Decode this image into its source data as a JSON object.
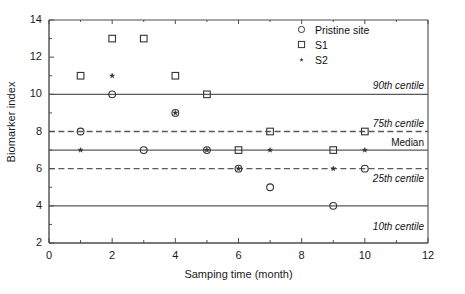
{
  "chart_data": {
    "type": "scatter",
    "title": "",
    "xlabel": "Samping time (month)",
    "ylabel": "Biomarker index",
    "xlim": [
      0,
      12
    ],
    "ylim": [
      2,
      14
    ],
    "xticks": [
      0,
      2,
      4,
      6,
      8,
      10,
      12
    ],
    "yticks": [
      2,
      4,
      6,
      8,
      10,
      12,
      14
    ],
    "xminor_step": 1,
    "yminor_step": 1,
    "grid": false,
    "legend_position": "top-right",
    "series": [
      {
        "name": "Pristine site",
        "marker": "circle",
        "x": [
          1,
          2,
          3,
          4,
          5,
          6,
          7,
          9,
          10
        ],
        "y": [
          8,
          10,
          7,
          9,
          7,
          6,
          5,
          4,
          6
        ]
      },
      {
        "name": "S1",
        "marker": "square",
        "x": [
          1,
          2,
          3,
          4,
          5,
          6,
          7,
          9,
          10
        ],
        "y": [
          11,
          13,
          13,
          11,
          10,
          7,
          8,
          7,
          8
        ]
      },
      {
        "name": "S2",
        "marker": "star",
        "x": [
          1,
          2,
          4,
          5,
          6,
          7,
          9,
          10
        ],
        "y": [
          7,
          11,
          9,
          7,
          6,
          7,
          6,
          7
        ]
      }
    ],
    "reference_lines": [
      {
        "label": "90th centile",
        "value": 10,
        "style": "solid"
      },
      {
        "label": "75th centile",
        "value": 8,
        "style": "dashed"
      },
      {
        "label": "Median",
        "value": 7,
        "style": "solid"
      },
      {
        "label": "25th centile",
        "value": 6,
        "style": "dashed"
      },
      {
        "label": "10th centile",
        "value": 4,
        "style": "solid"
      }
    ]
  },
  "axis": {
    "x_title": "Samping time (month)",
    "y_title": "Biomarker index",
    "x_tick_labels": [
      "0",
      "2",
      "4",
      "6",
      "8",
      "10",
      "12"
    ],
    "y_tick_labels": [
      "2",
      "4",
      "6",
      "8",
      "10",
      "12",
      "14"
    ]
  },
  "legend": {
    "items": [
      {
        "label": "Pristine site",
        "marker": "circle-marker-icon"
      },
      {
        "label": "S1",
        "marker": "square-marker-icon"
      },
      {
        "label": "S2",
        "marker": "star-marker-icon"
      }
    ]
  },
  "reference_labels": [
    {
      "text": "90th centile"
    },
    {
      "text": "75th centile"
    },
    {
      "text": "Median"
    },
    {
      "text": "25th centile"
    },
    {
      "text": "10th centile"
    }
  ],
  "colors": {
    "axis": "#4d4d4d",
    "reference_line": "#5a5a5a",
    "marker": "#333333",
    "text": "#1a1a1a",
    "background": "#ffffff"
  }
}
